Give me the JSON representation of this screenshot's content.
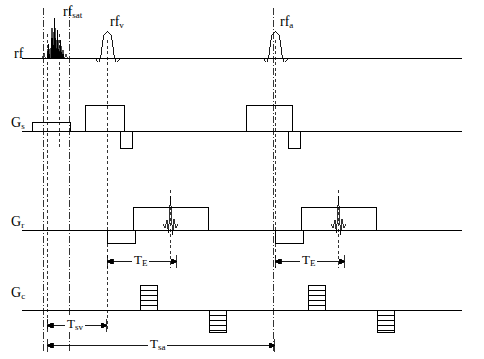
{
  "figure": {
    "type": "pulse-sequence-timing-diagram",
    "width": 484,
    "height": 359,
    "background": "#ffffff",
    "line_color": "#000000"
  },
  "labels": {
    "rf": "rf",
    "rf_sat": "rf",
    "rf_sat_sub": "sat",
    "rf_v": "rf",
    "rf_v_sub": "v",
    "rf_a": "rf",
    "rf_a_sub": "a",
    "gs": "G",
    "gs_sub": "s",
    "gr": "G",
    "gr_sub": "r",
    "gc": "G",
    "gc_sub": "c",
    "te1": "T",
    "te1_sub": "E",
    "te2": "T",
    "te2_sub": "E",
    "tsv": "T",
    "tsv_sub": "sv",
    "tsa": "T",
    "tsa_sub": "sa"
  },
  "channels": [
    {
      "name": "rf",
      "baseline_y": 58,
      "description": "RF channel with saturation pulse and two sinc excitation pulses"
    },
    {
      "name": "Gs",
      "baseline_y": 131,
      "description": "Slice selection gradient"
    },
    {
      "name": "Gr",
      "baseline_y": 230,
      "description": "Readout gradient with echo signals"
    },
    {
      "name": "Gc",
      "baseline_y": 310,
      "description": "Phase encoding gradient with ramped blips"
    }
  ],
  "timing_markers": {
    "dash_dot_vertical_x": [
      43,
      69,
      273
    ],
    "dashed_vertical_x": [
      47,
      59,
      107,
      170,
      275,
      338
    ]
  },
  "measure_bars": [
    {
      "name": "TE-first",
      "x1": 107,
      "x2": 177,
      "y": 261
    },
    {
      "name": "TE-second",
      "x1": 275,
      "x2": 345,
      "y": 261
    },
    {
      "name": "Tsv",
      "x1": 47,
      "x2": 107,
      "y": 325
    },
    {
      "name": "Tsa",
      "x1": 47,
      "x2": 275,
      "y": 345
    }
  ]
}
